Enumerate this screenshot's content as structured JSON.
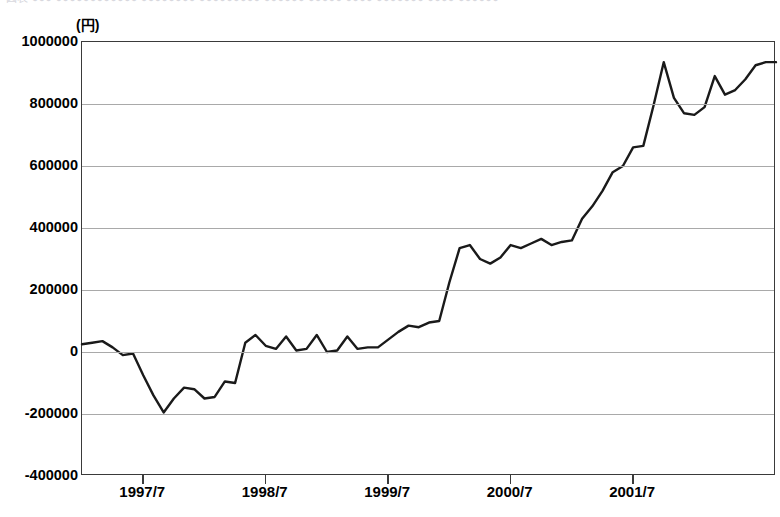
{
  "top_fragment": {
    "text": "図表 ●●● ●●●●●●●●●●●● ●●●●●●●● ●●●●●●●●● ●●●●●● ●●●●● ●●●● ●●●●●●● ●●●● ●●●●●●"
  },
  "chart_data": {
    "type": "line",
    "title": "",
    "subtitle": "",
    "xlabel": "",
    "ylabel": "",
    "unit_label": "(円)",
    "grid": true,
    "legend": "none",
    "ylim": [
      -400000,
      1000000
    ],
    "ytick_values": [
      1000000,
      800000,
      600000,
      400000,
      200000,
      0,
      -200000,
      -400000
    ],
    "ytick_labels": [
      "1000000",
      "800000",
      "600000",
      "400000",
      "200000",
      "0",
      "-200000",
      "-400000"
    ],
    "xtick_labels": [
      "1997/7",
      "1998/7",
      "1999/7",
      "2000/7",
      "2001/7"
    ],
    "xtick_index": [
      6,
      18,
      30,
      42,
      54
    ],
    "x_start": "1997/1",
    "x_end": "2001/12",
    "x_count": 60,
    "series": [
      {
        "name": "金額",
        "values": [
          25000,
          30000,
          35000,
          15000,
          -10000,
          -5000,
          -75000,
          -140000,
          -195000,
          -150000,
          -115000,
          -120000,
          -150000,
          -145000,
          -95000,
          -100000,
          30000,
          55000,
          20000,
          10000,
          50000,
          5000,
          10000,
          55000,
          0,
          5000,
          50000,
          10000,
          15000,
          15000,
          40000,
          65000,
          85000,
          80000,
          95000,
          100000,
          225000,
          335000,
          345000,
          300000,
          285000,
          305000,
          345000,
          335000,
          350000,
          365000,
          345000,
          355000,
          360000,
          430000,
          470000,
          520000,
          580000,
          600000,
          660000,
          665000,
          795000,
          935000,
          820000,
          770000,
          765000,
          790000,
          890000,
          830000,
          845000,
          880000,
          925000,
          935000,
          935000
        ]
      }
    ]
  }
}
